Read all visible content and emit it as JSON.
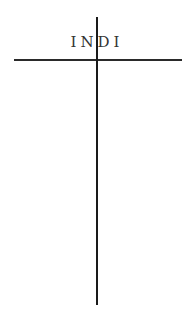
{
  "diagram": {
    "title": "INDI",
    "colors": {
      "background": "#ffffff",
      "line": "#1a1a1a",
      "text": "#333333"
    }
  }
}
